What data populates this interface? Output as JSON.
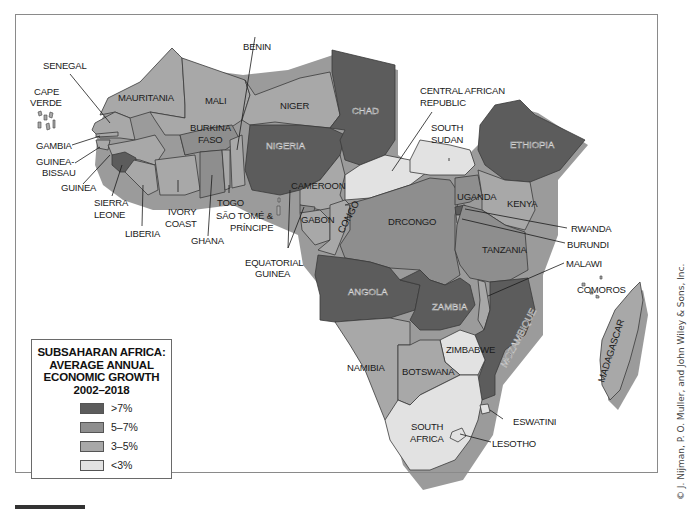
{
  "legend": {
    "title_lines": [
      "SUBSAHARAN AFRICA:",
      "AVERAGE ANNUAL",
      "ECONOMIC GROWTH",
      "2002–2018"
    ],
    "items": [
      {
        "label": ">7%",
        "color": "#5c5c5c"
      },
      {
        "label": "5–7%",
        "color": "#8e8e8e"
      },
      {
        "label": "3–5%",
        "color": "#a8a8a8"
      },
      {
        "label": "<3%",
        "color": "#e2e2e2"
      }
    ]
  },
  "colors": {
    "gt7": "#5c5c5c",
    "5to7": "#8e8e8e",
    "3to5": "#a8a8a8",
    "lt3": "#e2e2e2",
    "shadow": "#7a7a7a",
    "frame": "#8a8a8a"
  },
  "countries": {
    "cape_verde": {
      "label": "CAPE\nVERDE",
      "class": "3-5%"
    },
    "senegal": {
      "label": "SENEGAL",
      "class": "3-5%"
    },
    "mauritania": {
      "label": "MAURITANIA",
      "class": "3-5%"
    },
    "mali": {
      "label": "MALI",
      "class": "3-5%"
    },
    "benin": {
      "label": "BENIN",
      "class": "3-5%"
    },
    "niger": {
      "label": "NIGER",
      "class": "3-5%"
    },
    "chad": {
      "label": "CHAD",
      "class": ">7%"
    },
    "nigeria": {
      "label": "NIGERIA",
      "class": ">7%"
    },
    "burkina_faso": {
      "label": "BURKINA\nFASO",
      "class": "5-7%"
    },
    "gambia": {
      "label": "GAMBIA",
      "class": "3-5%"
    },
    "guinea_bissau": {
      "label": "GUINEA-\nBISSAU",
      "class": "3-5%"
    },
    "guinea": {
      "label": "GUINEA",
      "class": "3-5%"
    },
    "sierra_leone": {
      "label": "SIERRA\nLEONE",
      "class": ">7%"
    },
    "liberia": {
      "label": "LIBERIA",
      "class": "3-5%"
    },
    "ivory_coast": {
      "label": "IVORY\nCOAST",
      "class": "3-5%"
    },
    "ghana": {
      "label": "GHANA",
      "class": "5-7%"
    },
    "togo": {
      "label": "TOGO",
      "class": "3-5%"
    },
    "sao_tome": {
      "label": "SÃO TOMÉ &\nPRÍNCIPE",
      "class": "3-5%"
    },
    "cameroon": {
      "label": "CAMEROON",
      "class": "3-5%"
    },
    "gabon": {
      "label": "GABON",
      "class": "3-5%"
    },
    "congo": {
      "label": "CONGO",
      "class": "3-5%"
    },
    "equatorial_guinea": {
      "label": "EQUATORIAL\nGUINEA",
      "class": "5-7%"
    },
    "central_african_republic": {
      "label": "CENTRAL AFRICAN\nREPUBLIC",
      "class": "<3%"
    },
    "south_sudan": {
      "label": "SOUTH\nSUDAN",
      "class": "<3%"
    },
    "ethiopia": {
      "label": "ETHIOPIA",
      "class": ">7%"
    },
    "drcongo": {
      "label": "DRCONGO",
      "class": "5-7%"
    },
    "uganda": {
      "label": "UGANDA",
      "class": "5-7%"
    },
    "kenya": {
      "label": "KENYA",
      "class": "3-5%"
    },
    "rwanda": {
      "label": "RWANDA",
      "class": ">7%"
    },
    "burundi": {
      "label": "BURUNDI",
      "class": "3-5%"
    },
    "tanzania": {
      "label": "TANZANIA",
      "class": "5-7%"
    },
    "malawi": {
      "label": "MALAWI",
      "class": "3-5%"
    },
    "comoros": {
      "label": "COMOROS",
      "class": "3-5%"
    },
    "angola": {
      "label": "ANGOLA",
      "class": ">7%"
    },
    "zambia": {
      "label": "ZAMBIA",
      "class": ">7%"
    },
    "mozambique": {
      "label": "MOZAMBIQUE",
      "class": ">7%"
    },
    "madagascar": {
      "label": "MADAGASCAR",
      "class": "3-5%"
    },
    "zimbabwe": {
      "label": "ZIMBABWE",
      "class": "<3%"
    },
    "namibia": {
      "label": "NAMIBIA",
      "class": "3-5%"
    },
    "botswana": {
      "label": "BOTSWANA",
      "class": "3-5%"
    },
    "south_africa": {
      "label": "SOUTH\nAFRICA",
      "class": "<3%"
    },
    "eswatini": {
      "label": "ESWATINI",
      "class": "<3%"
    },
    "lesotho": {
      "label": "LESOTHO",
      "class": "<3%"
    }
  },
  "credit": "© J. Nijman, P. O. Muller, and John Wiley & Sons, Inc."
}
